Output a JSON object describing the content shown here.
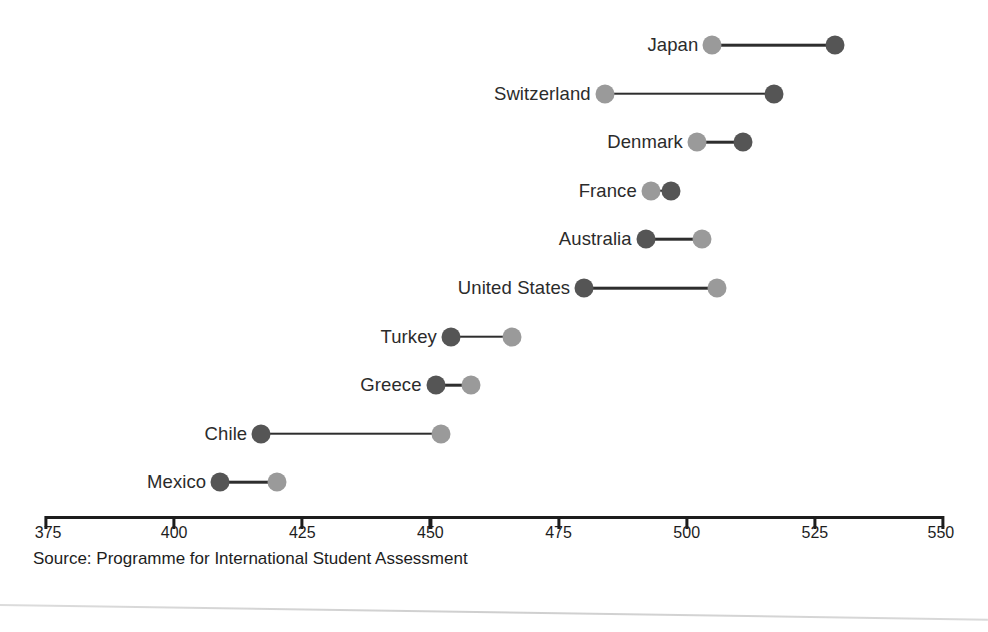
{
  "chart_data": {
    "type": "dumbbell",
    "title": "",
    "subtitle": "",
    "xlabel": "",
    "ylabel": "",
    "xlim": [
      375,
      550
    ],
    "xticks": [
      375,
      400,
      425,
      450,
      475,
      500,
      525,
      550
    ],
    "xtick_labels": [
      "375",
      "400",
      "425",
      "450",
      "475",
      "500",
      "525",
      "550"
    ],
    "grid": false,
    "legend_position": "none",
    "categories": [
      "Japan",
      "Switzerland",
      "Denmark",
      "France",
      "Australia",
      "United States",
      "Turkey",
      "Greece",
      "Chile",
      "Mexico"
    ],
    "series": [
      {
        "name": "light",
        "color": "#9a9a9a",
        "values": [
          505,
          484,
          502,
          493,
          503,
          506,
          466,
          458,
          452,
          420
        ]
      },
      {
        "name": "dark",
        "color": "#555555",
        "values": [
          529,
          517,
          511,
          497,
          492,
          480,
          454,
          451,
          417,
          409
        ]
      }
    ],
    "points": [
      {
        "category": "Japan",
        "light": 505,
        "dark": 529
      },
      {
        "category": "Switzerland",
        "light": 484,
        "dark": 517
      },
      {
        "category": "Denmark",
        "light": 502,
        "dark": 511
      },
      {
        "category": "France",
        "light": 493,
        "dark": 497
      },
      {
        "category": "Australia",
        "light": 503,
        "dark": 492
      },
      {
        "category": "United States",
        "light": 506,
        "dark": 480
      },
      {
        "category": "Turkey",
        "light": 466,
        "dark": 454
      },
      {
        "category": "Greece",
        "light": 458,
        "dark": 451
      },
      {
        "category": "Chile",
        "light": 452,
        "dark": 417
      },
      {
        "category": "Mexico",
        "light": 420,
        "dark": 409
      }
    ],
    "source_note": "Source: Programme for International Student Assessment",
    "colors": {
      "light_marker": "#9a9a9a",
      "dark_marker": "#555555",
      "connector": "#2e2e2e",
      "axis": "#1d1d1d",
      "text": "#231f20",
      "background": "#ffffff"
    }
  },
  "axis": {
    "pixel_left": 46,
    "pixel_right": 943,
    "value_left": 375,
    "value_right": 550,
    "line_y": 516,
    "tick_height": 13,
    "label_y": 524
  },
  "layout": {
    "first_row_y": 45,
    "row_spacing": 48.6
  }
}
